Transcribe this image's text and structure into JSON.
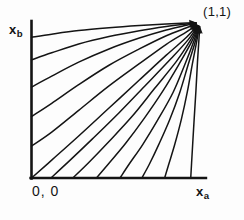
{
  "figure": {
    "kind": "phase-portrait",
    "background_color": "#fdfdfd",
    "ink_color": "#141414",
    "axis_labels": {
      "y_base": "x",
      "y_sub": "b",
      "x_base": "x",
      "x_sub": "a"
    },
    "origin_label": "0, 0",
    "fixed_point_label": "(1,1)"
  },
  "chart_data": {
    "type": "line",
    "title": "",
    "subtitle": "",
    "xlabel": "x_a",
    "ylabel": "x_b",
    "xlim": [
      0,
      1
    ],
    "ylim": [
      0,
      1
    ],
    "grid": false,
    "legend": false,
    "legend_position": "none",
    "annotations": [
      {
        "text": "(1,1)",
        "x": 1.0,
        "y": 1.0,
        "role": "stable-fixed-point"
      },
      {
        "text": "0, 0",
        "x": 0.0,
        "y": 0.0,
        "role": "origin"
      }
    ],
    "convergence_point": {
      "x": 1.0,
      "y": 1.0
    },
    "arrowheads": true,
    "series": [
      {
        "name": "trajectory-1",
        "start_axis": "y",
        "start": [
          0.0,
          0.905
        ],
        "x": [
          0.0,
          0.12,
          0.28,
          0.46,
          0.64,
          0.8,
          0.92,
          1.0
        ],
        "y": [
          0.905,
          0.925,
          0.948,
          0.966,
          0.98,
          0.99,
          0.996,
          1.0
        ]
      },
      {
        "name": "trajectory-2",
        "start_axis": "y",
        "start": [
          0.0,
          0.76
        ],
        "x": [
          0.0,
          0.12,
          0.28,
          0.46,
          0.64,
          0.8,
          0.92,
          1.0
        ],
        "y": [
          0.76,
          0.805,
          0.862,
          0.91,
          0.947,
          0.974,
          0.99,
          1.0
        ]
      },
      {
        "name": "trajectory-3",
        "start_axis": "y",
        "start": [
          0.0,
          0.585
        ],
        "x": [
          0.0,
          0.12,
          0.28,
          0.46,
          0.64,
          0.8,
          0.92,
          1.0
        ],
        "y": [
          0.585,
          0.655,
          0.745,
          0.83,
          0.9,
          0.952,
          0.982,
          1.0
        ]
      },
      {
        "name": "trajectory-4",
        "start_axis": "y",
        "start": [
          0.0,
          0.395
        ],
        "x": [
          0.0,
          0.12,
          0.28,
          0.46,
          0.64,
          0.8,
          0.92,
          1.0
        ],
        "y": [
          0.395,
          0.48,
          0.6,
          0.725,
          0.83,
          0.915,
          0.966,
          1.0
        ]
      },
      {
        "name": "trajectory-5",
        "start_axis": "y",
        "start": [
          0.0,
          0.205
        ],
        "x": [
          0.0,
          0.12,
          0.28,
          0.46,
          0.64,
          0.8,
          0.92,
          1.0
        ],
        "y": [
          0.205,
          0.295,
          0.435,
          0.592,
          0.735,
          0.86,
          0.94,
          1.0
        ]
      },
      {
        "name": "trajectory-6",
        "start_axis": "origin",
        "start": [
          0.0,
          0.0
        ],
        "x": [
          0.0,
          0.12,
          0.28,
          0.46,
          0.64,
          0.8,
          0.92,
          1.0
        ],
        "y": [
          0.0,
          0.115,
          0.27,
          0.45,
          0.63,
          0.79,
          0.905,
          1.0
        ]
      },
      {
        "name": "trajectory-7",
        "start_axis": "x",
        "start": [
          0.115,
          0.0
        ],
        "x": [
          0.115,
          0.22,
          0.36,
          0.52,
          0.68,
          0.83,
          0.93,
          1.0
        ],
        "y": [
          0.0,
          0.105,
          0.25,
          0.42,
          0.6,
          0.77,
          0.89,
          1.0
        ]
      },
      {
        "name": "trajectory-8",
        "start_axis": "x",
        "start": [
          0.245,
          0.0
        ],
        "x": [
          0.245,
          0.34,
          0.46,
          0.6,
          0.73,
          0.86,
          0.94,
          1.0
        ],
        "y": [
          0.0,
          0.1,
          0.235,
          0.4,
          0.575,
          0.75,
          0.88,
          1.0
        ]
      },
      {
        "name": "trajectory-9",
        "start_axis": "x",
        "start": [
          0.385,
          0.0
        ],
        "x": [
          0.385,
          0.46,
          0.56,
          0.67,
          0.78,
          0.88,
          0.95,
          1.0
        ],
        "y": [
          0.0,
          0.095,
          0.225,
          0.385,
          0.56,
          0.74,
          0.875,
          1.0
        ]
      },
      {
        "name": "trajectory-10",
        "start_axis": "x",
        "start": [
          0.525,
          0.0
        ],
        "x": [
          0.525,
          0.58,
          0.66,
          0.75,
          0.84,
          0.91,
          0.96,
          1.0
        ],
        "y": [
          0.0,
          0.09,
          0.215,
          0.375,
          0.55,
          0.73,
          0.87,
          1.0
        ]
      },
      {
        "name": "trajectory-11",
        "start_axis": "x",
        "start": [
          0.655,
          0.0
        ],
        "x": [
          0.655,
          0.7,
          0.755,
          0.82,
          0.88,
          0.93,
          0.97,
          1.0
        ],
        "y": [
          0.0,
          0.09,
          0.215,
          0.375,
          0.55,
          0.73,
          0.87,
          1.0
        ]
      },
      {
        "name": "trajectory-12",
        "start_axis": "x",
        "start": [
          0.79,
          0.0
        ],
        "x": [
          0.79,
          0.815,
          0.85,
          0.89,
          0.925,
          0.955,
          0.98,
          1.0
        ],
        "y": [
          0.0,
          0.09,
          0.215,
          0.38,
          0.555,
          0.735,
          0.875,
          1.0
        ]
      },
      {
        "name": "trajectory-13",
        "start_axis": "x",
        "start": [
          0.945,
          0.0
        ],
        "x": [
          0.945,
          0.95,
          0.957,
          0.966,
          0.976,
          0.985,
          0.993,
          1.0
        ],
        "y": [
          0.0,
          0.095,
          0.225,
          0.39,
          0.565,
          0.745,
          0.88,
          1.0
        ]
      }
    ]
  }
}
